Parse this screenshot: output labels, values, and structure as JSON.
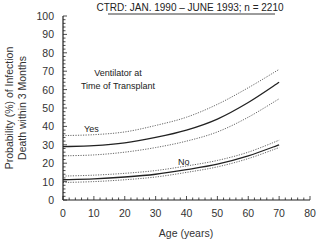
{
  "chart_data": {
    "type": "line",
    "title": "CTRD:   JAN. 1990 – JUNE 1993;  n = 2210",
    "xlabel": "Age (years)",
    "ylabel_line1": "Probability (%) of Infection",
    "ylabel_line2": "Death within 3 Months",
    "xlim": [
      0,
      80
    ],
    "ylim": [
      0,
      100
    ],
    "xticks": [
      0,
      10,
      20,
      30,
      40,
      50,
      60,
      70,
      80
    ],
    "yticks": [
      0,
      10,
      20,
      30,
      40,
      50,
      60,
      70,
      80,
      90,
      100
    ],
    "grid": false,
    "legend_title_line1": "Ventilator at",
    "legend_title_line2": "Time of Transplant",
    "x": [
      0,
      10,
      20,
      30,
      40,
      50,
      60,
      70
    ],
    "series": [
      {
        "name": "Yes",
        "style": "solid",
        "values": [
          29,
          29.5,
          31,
          34,
          38,
          44,
          53,
          64
        ]
      },
      {
        "name": "Yes upper CI",
        "style": "dotted",
        "values": [
          35,
          35.5,
          37,
          40.5,
          45,
          52,
          61,
          71
        ]
      },
      {
        "name": "Yes lower CI",
        "style": "dotted",
        "values": [
          24,
          24.5,
          26,
          28.5,
          32,
          37,
          45,
          55
        ]
      },
      {
        "name": "No",
        "style": "solid",
        "values": [
          11,
          11.5,
          12.5,
          14,
          16.5,
          19.5,
          24,
          30
        ]
      },
      {
        "name": "No upper CI",
        "style": "dotted",
        "values": [
          13,
          13.5,
          14.5,
          16,
          18.5,
          21.5,
          26,
          32.5
        ]
      },
      {
        "name": "No lower CI",
        "style": "dotted",
        "values": [
          9.5,
          10,
          11,
          12.5,
          15,
          18,
          22.5,
          28.5
        ]
      }
    ],
    "annotations": [
      {
        "text": "Yes",
        "x": 8,
        "y": 38
      },
      {
        "text": "No",
        "x": 33,
        "y": 20
      }
    ]
  }
}
